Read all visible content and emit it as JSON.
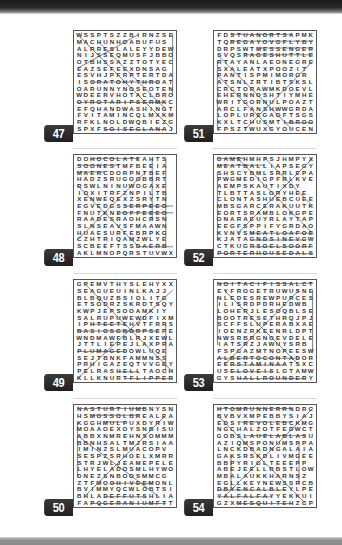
{
  "page": {
    "puzzles": [
      {
        "number": "47",
        "rows": [
          "WSSPTSZZBIRNZSE",
          "MACHUNHOABUFUS",
          "ALRRESLALEYYDEW",
          "NIJSSEQMUSFJBBO",
          "OTBHSSAZZTOTYEC",
          "EAZSEFEEXDNSAG",
          "ESVHJPFRPTERTDA",
          "ISORATOHYTHROAT",
          "OARUNNYNOSEOTEN",
          "WDEERVHOTACLBRO",
          "OYROTARIPSERMKC",
          "EFQHANDWASHINGT",
          "FVITAMINCQLMXKM",
          "RFKLNOLDWQBIEZG",
          "SPXFSOISEGLANAJE"
        ]
      },
      {
        "number": "48",
        "rows": [
          "DOHOCOLATEAHTS",
          "SOONESTMFBEEIA",
          "MAERCDORPNTBEF",
          "HADZSRUGOOBBRT",
          "RSWLNINUWOGAXE",
          "IOXITRFZNPILTB",
          "XENWEQEXZSRYTN",
          "EGVEDGSSERPEEO",
          "FNUTKNEOFFEEEO",
          "RAADESRAOHCRSN",
          "SLNSEAVSFMAAWN",
          "HUAESURFEBRPKG",
          "CZHTRIQAMZWLYE",
          "SCBEEFTSSDAERB",
          "AKLMNOPQRSTUVWX"
        ]
      },
      {
        "number": "49",
        "rows": [
          "GPEMVTHYSLEHYXX",
          "SEAGUEUINLKAJJ",
          "BLBQUZBSIOLITG",
          "ETSODRZSKRDTSQY",
          "KWPJEPSOOAMKIY",
          "SALRUPUWEWDFIXM",
          "IPHTEETEHVTFRRS",
          "BASIOSGBORPSEPE",
          "WNDMAWFBLRJXEWL",
          "JTTLIEPEJLAXPRA",
          "PLUMAGEDOWLUQE",
          "SEJTBNKFAMMNSS",
          "PRHIGAZEQTVVGEY",
          "PELRASHELLTAOCH",
          "KLLKNURTFLIPPER"
        ]
      },
      {
        "number": "50",
        "rows": [
          "NASTURTIUMBNYSN",
          "HSMOSSOLBREALEA",
          "KGGHMULPUXDYRIW",
          "MOAAOEXOYSNBISU",
          "ABBXNMREHNSOMMM",
          "BBNHSALTMJRSIAA",
          "IMINZSLMUACOPV",
          "SESPZSRHOELXMRR",
          "STRJWLJEAMEPELE",
          "LHYELADOSMLHYWO",
          "DNEZSNBOOSMMCG",
          "ZTFMOOHIVEEMONL",
          "BVIMMYQCWLOBTSI",
          "BHLADEFFUTSHLIA",
          "FAPQGERANIUMFTT"
        ]
      },
      {
        "number": "51",
        "rows": [
          "FDSTUANORTSAPMK",
          "TQREGAYOVGFLYBY",
          "DRPSWTMESSENGER",
          "SVQSRAGESHUTTLE",
          "RTAYANLAEONEGRE",
          "SXALEATXPOOZIT",
          "PANTISPMIMORGR",
          "ATSNLZRTIBTSKSL",
          "CRCTORAWMKDOEVL",
          "EHERNNOSHTIYMHE",
          "WRITGORNULPOAZT",
          "ARCLFANSHWWGRDA",
          "LOPLUREGAOFTSGS",
          "KXLTCHUSMTIBROO",
          "FPSZTWUXGYOUCEN"
        ]
      },
      {
        "number": "52",
        "rows": [
          "GAMEHMHPSJHMPYX",
          "MEATBALLIAPSEGY",
          "SHSCYBMLSRRLEPA",
          "PWGMEDIGPFRLKVE",
          "AEMPSKAUTIXDY",
          "TLBTTASLORYHEE",
          "CLONTASHUEBCUEE",
          "MBSGARCERAKUUTK",
          "EORTSRAMBLOKGPE",
          "ONARAEUYRLAYTAP",
          "EEGFSPPIFYGRDAOD",
          "KVNVSMEATLOAFOE",
          "KJATAGNDSINEVGW",
          "CTKUGRSOELSOORF",
          "PORTERHOUSEDALS"
        ]
      },
      {
        "number": "53",
        "rows": [
          "NOITACIFISSALCT",
          "EYFROGETRUWUSNE",
          "NLEDESREWPURCES",
          "ILISRDPDRHEDWB",
          "LOHERJLESOQBLSE",
          "BOOTRESETHRQJPJ",
          "SCFFSLUPERABXAE",
          "IOENZRKEENRLDPT",
          "NWSRBRGNOEVDELE",
          "IATSRZJAWUYSRB",
          "FSPGAZMTNOPEESW",
          "ALBERTOCONTADOR",
          "EERSTAMINAATSXC",
          "USELOVEISLGTAMW",
          "GYSHALLROUNDERY"
        ]
      },
      {
        "number": "54",
        "rows": [
          "HTOMRUNNERRNDRC",
          "BVBVXMPEBBYSIAJ",
          "EDSIREVOLEBCKMG",
          "NGCHALZOTFEDWCT",
          "GOBSLAUELABLASU",
          "AZIQMSPONUMSPPA",
          "LNCKDBADNGALAIA",
          "GAKSRSKDLIVMGEE",
          "BBPYRIGLTEEEPP",
          "ABEJEELLRBSTLOWA",
          "MBALAUKKHARNSZ",
          "EGLLKEYNEWSSRCB",
          "DBYENCALBLEYLPE",
          "YALFALFAYYEKKUI",
          "GZXMESQUITEHZCP"
        ]
      }
    ]
  }
}
